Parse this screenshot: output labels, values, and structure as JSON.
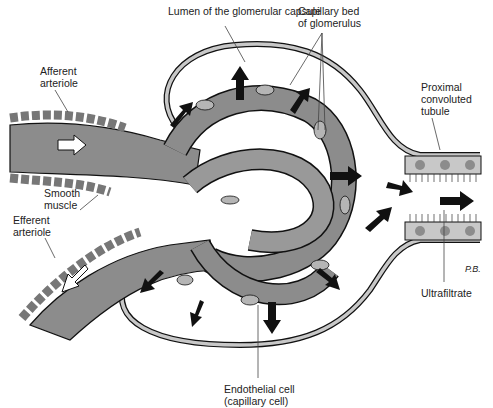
{
  "labels": {
    "lumen": "Lumen of the glomerular capsule",
    "capillary_bed": "Capillary bed\nof glomerulus",
    "afferent": "Afferent\narteriole",
    "smooth_muscle": "Smooth\nmuscle",
    "efferent": "Efferent\narteriole",
    "proximal": "Proximal\nconvoluted\ntubule",
    "ultrafiltrate": "Ultrafiltrate",
    "endothelial": "Endothelial cell\n(capillary cell)",
    "signature": "P.B."
  },
  "colors": {
    "vessel": "#8c8c8c",
    "vessel_dark": "#6e6e6e",
    "cell": "#b5b5b5",
    "capsule": "#c8c8c8",
    "outline": "#111111",
    "arrow": "#111111"
  }
}
